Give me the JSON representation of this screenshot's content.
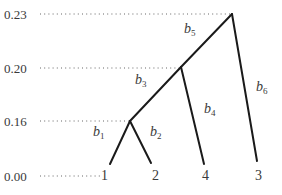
{
  "diagram": {
    "type": "ultrametric-tree",
    "y_axis": {
      "ticks": [
        {
          "value": "0.23",
          "y": 14
        },
        {
          "value": "0.20",
          "y": 68
        },
        {
          "value": "0.16",
          "y": 121
        },
        {
          "value": "0.00",
          "y": 176
        }
      ]
    },
    "leaves": [
      {
        "label": "1"
      },
      {
        "label": "2"
      },
      {
        "label": "4"
      },
      {
        "label": "3"
      }
    ],
    "branches": [
      {
        "name": "b",
        "sub": "1"
      },
      {
        "name": "b",
        "sub": "2"
      },
      {
        "name": "b",
        "sub": "3"
      },
      {
        "name": "b",
        "sub": "4"
      },
      {
        "name": "b",
        "sub": "5"
      },
      {
        "name": "b",
        "sub": "6"
      }
    ],
    "colors": {
      "line": "#1a1a1a",
      "dots": "#555555",
      "text": "#3a3a3a"
    }
  }
}
